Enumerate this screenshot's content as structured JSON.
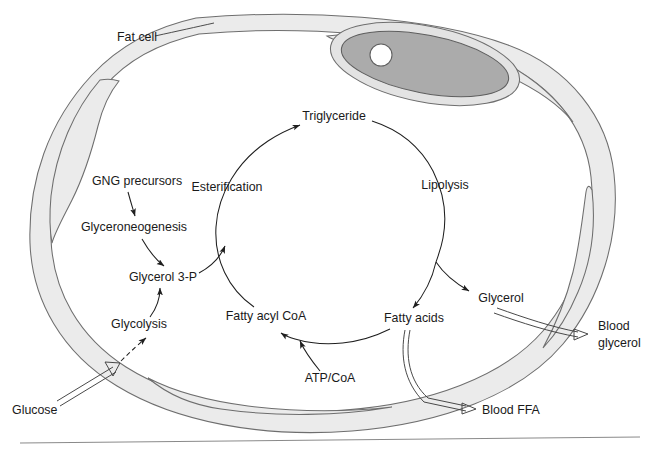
{
  "figure": {
    "cell_label": "Fat cell",
    "background_color": "#ffffff",
    "membrane_fill": "#ebebeb",
    "membrane_stroke": "#6e6e6e",
    "nucleus_fill": "#ababab",
    "nucleolus_fill": "#ffffff",
    "arrow_color": "#1f1f1f",
    "text_color": "#1a1a1a"
  },
  "labels": {
    "fat_cell": "Fat cell",
    "gng_precursors": "GNG precursors",
    "glyceroneogenesis": "Glyceroneogenesis",
    "glycerol_3p": "Glycerol 3-P",
    "glycolysis": "Glycolysis",
    "glucose": "Glucose",
    "esterification": "Esterification",
    "triglyceride": "Triglyceride",
    "lipolysis": "Lipolysis",
    "glycerol": "Glycerol",
    "fatty_acids": "Fatty acids",
    "fatty_acyl_coa": "Fatty acyl CoA",
    "atp_coa": "ATP/CoA",
    "blood_ffa": "Blood FFA",
    "blood_glycerol_line1": "Blood",
    "blood_glycerol_line2": "glycerol"
  },
  "nodes": [
    {
      "id": "gng-precursors",
      "label": "GNG precursors",
      "x": 137,
      "y": 185
    },
    {
      "id": "glyceroneogenesis",
      "label": "Glyceroneogenesis",
      "x": 134,
      "y": 231
    },
    {
      "id": "glycerol-3p",
      "label": "Glycerol 3-P",
      "x": 163,
      "y": 280
    },
    {
      "id": "glycolysis",
      "label": "Glycolysis",
      "x": 139,
      "y": 327
    },
    {
      "id": "glucose",
      "label": "Glucose",
      "x": 42,
      "y": 410
    },
    {
      "id": "esterification",
      "label": "Esterification",
      "x": 227,
      "y": 190
    },
    {
      "id": "triglyceride",
      "label": "Triglyceride",
      "x": 330,
      "y": 119
    },
    {
      "id": "lipolysis",
      "label": "Lipolysis",
      "x": 444,
      "y": 188
    },
    {
      "id": "glycerol",
      "label": "Glycerol",
      "x": 500,
      "y": 301
    },
    {
      "id": "fatty-acids",
      "label": "Fatty acids",
      "x": 412,
      "y": 321
    },
    {
      "id": "fatty-acyl-coa",
      "label": "Fatty acyl CoA",
      "x": 266,
      "y": 319
    },
    {
      "id": "atp-coa",
      "label": "ATP/CoA",
      "x": 330,
      "y": 381
    },
    {
      "id": "blood-ffa",
      "label": "Blood FFA",
      "x": 483,
      "y": 414
    },
    {
      "id": "blood-glycerol",
      "label": "Blood glycerol",
      "x": 601,
      "y": 332
    }
  ],
  "edges": [
    {
      "id": "gng-to-glyceroneogenesis",
      "from": "GNG precursors",
      "to": "Glyceroneogenesis",
      "style": "solid"
    },
    {
      "id": "glyceroneogenesis-to-g3p",
      "from": "Glyceroneogenesis",
      "to": "Glycerol 3-P",
      "style": "solid"
    },
    {
      "id": "glycolysis-to-g3p",
      "from": "Glycolysis",
      "to": "Glycerol 3-P",
      "style": "solid"
    },
    {
      "id": "glucose-to-glycolysis",
      "from": "Glucose",
      "to": "Glycolysis",
      "style": "dashed-transport"
    },
    {
      "id": "g3p-to-cycle",
      "from": "Glycerol 3-P",
      "to": "Esterification",
      "style": "solid"
    },
    {
      "id": "esterification-arc",
      "from": "Fatty acyl CoA",
      "to": "Triglyceride",
      "style": "solid"
    },
    {
      "id": "lipolysis-arc-fa",
      "from": "Triglyceride",
      "to": "Fatty acids",
      "style": "solid"
    },
    {
      "id": "lipolysis-arc-glycerol",
      "from": "Triglyceride",
      "to": "Glycerol",
      "style": "solid"
    },
    {
      "id": "fa-to-facoa",
      "from": "Fatty acids",
      "to": "Fatty acyl CoA",
      "style": "solid"
    },
    {
      "id": "atpcoa-to-facoa",
      "from": "ATP/CoA",
      "to": "Fatty acyl CoA",
      "style": "solid"
    },
    {
      "id": "fa-to-blood-ffa",
      "from": "Fatty acids",
      "to": "Blood FFA",
      "style": "transport"
    },
    {
      "id": "glycerol-to-blood",
      "from": "Glycerol",
      "to": "Blood glycerol",
      "style": "transport"
    }
  ]
}
